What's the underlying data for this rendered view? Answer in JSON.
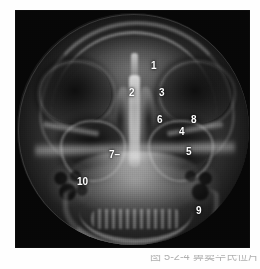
{
  "figure": {
    "kind": "radiograph",
    "modality": "X-ray",
    "view": "Waters (occipitomental) projection of the paranasal sinuses",
    "alt": "Black and white skull radiograph in Waters view showing orbits, maxillary sinuses, nasal septum and mandible, with ten white numeric annotation labels"
  },
  "annotations": [
    {
      "id": "1",
      "text": "1",
      "x": 136,
      "y": 51,
      "leader": false
    },
    {
      "id": "2",
      "text": "2",
      "x": 114,
      "y": 78,
      "leader": false
    },
    {
      "id": "3",
      "text": "3",
      "x": 144,
      "y": 78,
      "leader": false
    },
    {
      "id": "6",
      "text": "6",
      "x": 142,
      "y": 105,
      "leader": false
    },
    {
      "id": "8",
      "text": "8",
      "x": 176,
      "y": 105,
      "leader": false
    },
    {
      "id": "4",
      "text": "4",
      "x": 164,
      "y": 117,
      "leader": false
    },
    {
      "id": "5",
      "text": "5",
      "x": 171,
      "y": 137,
      "leader": false
    },
    {
      "id": "7",
      "text": "7",
      "x": 94,
      "y": 140,
      "leader": true
    },
    {
      "id": "10",
      "text": "10",
      "x": 62,
      "y": 167,
      "leader": false
    },
    {
      "id": "9",
      "text": "9",
      "x": 181,
      "y": 196,
      "leader": false
    }
  ],
  "caption": {
    "text": "图 5-2-4  鼻窦华氏位片",
    "visible_fragment": true
  },
  "colors": {
    "page_background": "#ffffff",
    "plate_background": "#070707",
    "label_text": "#ffffff",
    "caption_text": "#6e6e6e"
  }
}
